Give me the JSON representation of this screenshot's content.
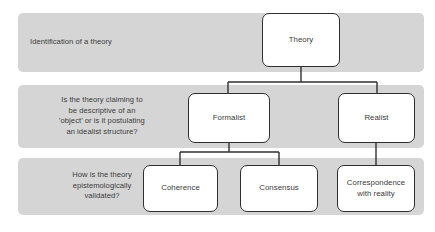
{
  "diagram": {
    "colors": {
      "band_fill": "#d5d5d5",
      "node_fill": "#ffffff",
      "node_border": "#2f2f2f",
      "text": "#3b3b3b",
      "connector": "#2f2f2f",
      "page_background": "#ffffff"
    },
    "bands": [
      {
        "id": "band-identification",
        "label": "Identification of a theory",
        "align": "left"
      },
      {
        "id": "band-descriptive-question",
        "label": "Is the theory claiming to\nbe descriptive of an\n'object' or is it postulating\nan idealist structure?",
        "align": "center"
      },
      {
        "id": "band-validation-question",
        "label": "How is the theory\nepistemologically\nvalidated?",
        "align": "center"
      }
    ],
    "nodes": {
      "theory": "Theory",
      "formalist": "Formalist",
      "realist": "Realist",
      "coherence": "Coherence",
      "consensus": "Consensus",
      "correspondence": "Correspondence\nwith reality"
    },
    "edges": [
      {
        "from": "theory",
        "to": "formalist"
      },
      {
        "from": "theory",
        "to": "realist"
      },
      {
        "from": "formalist",
        "to": "coherence"
      },
      {
        "from": "formalist",
        "to": "consensus"
      },
      {
        "from": "realist",
        "to": "correspondence"
      }
    ]
  }
}
